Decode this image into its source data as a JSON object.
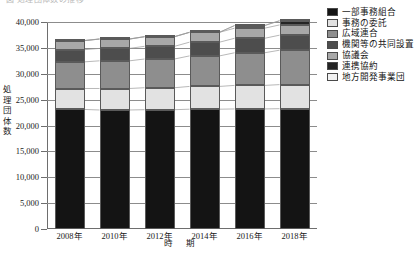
{
  "top_clipped_caption": "図 処理団体数の推移",
  "axes": {
    "y_title": "処理団体数",
    "x_title": "時 期",
    "y_ticks": [
      "0",
      "5,000",
      "10,000",
      "15,000",
      "20,000",
      "25,000",
      "30,000",
      "35,000",
      "40,000"
    ],
    "x_ticks": [
      "2008年",
      "2010年",
      "2012年",
      "2014年",
      "2016年",
      "2018年"
    ]
  },
  "legend": {
    "items": [
      {
        "label": "一部事務組合",
        "color": "#141414"
      },
      {
        "label": "事務の委託",
        "color": "#e2e2e2"
      },
      {
        "label": "広域連合",
        "color": "#8e8e8e"
      },
      {
        "label": "機関等の共同設置",
        "color": "#4d4d4d"
      },
      {
        "label": "協議会",
        "color": "#a8a8a8"
      },
      {
        "label": "連携協約",
        "color": "#242424"
      },
      {
        "label": "地方開発事業団",
        "color": "#f2f2f2"
      }
    ]
  },
  "chart_data": {
    "type": "bar",
    "title": "処理団体数の推移",
    "xlabel": "時 期",
    "ylabel": "処理団体数",
    "ylim": [
      0,
      40000
    ],
    "ytick_step": 5000,
    "grid": true,
    "stacked": true,
    "legend_position": "right",
    "categories": [
      "2008年",
      "2010年",
      "2012年",
      "2014年",
      "2016年",
      "2018年"
    ],
    "series": [
      {
        "name": "一部事務組合",
        "color": "#141414",
        "values": [
          23100,
          23000,
          23050,
          23150,
          23200,
          23250
        ]
      },
      {
        "name": "事務の委託",
        "color": "#e2e2e2",
        "values": [
          4050,
          4150,
          4250,
          4400,
          4550,
          4650
        ]
      },
      {
        "name": "広域連合",
        "color": "#8e8e8e",
        "values": [
          5150,
          5350,
          5550,
          5900,
          6300,
          6650
        ]
      },
      {
        "name": "機関等の共同設置",
        "color": "#4d4d4d",
        "values": [
          2350,
          2400,
          2450,
          2650,
          2800,
          2900
        ]
      },
      {
        "name": "協議会",
        "color": "#a8a8a8",
        "values": [
          1750,
          1800,
          1850,
          1900,
          1950,
          1980
        ]
      },
      {
        "name": "連携協約",
        "color": "#242424",
        "values": [
          0,
          0,
          0,
          0,
          500,
          800
        ]
      },
      {
        "name": "地方開発事業団",
        "color": "#f2f2f2",
        "values": [
          30,
          30,
          30,
          25,
          25,
          20
        ]
      }
    ],
    "totals": [
      36430,
      36730,
      37180,
      38025,
      39325,
      40250
    ]
  }
}
